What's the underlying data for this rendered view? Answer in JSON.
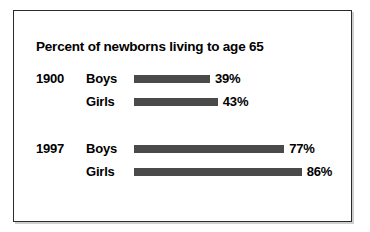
{
  "frame": {
    "border_color": "#2b2b2b",
    "background": "#ffffff"
  },
  "chart_data": {
    "type": "bar",
    "orientation": "horizontal",
    "title": "Percent of newborns living to age 65",
    "xlabel": "",
    "ylabel": "",
    "xlim": [
      0,
      100
    ],
    "grid": false,
    "legend": "none",
    "bar_color": "#4a4a4a",
    "groups": [
      {
        "label": "1900",
        "rows": [
          {
            "category": "Boys",
            "value": 39,
            "value_label": "39%"
          },
          {
            "category": "Girls",
            "value": 43,
            "value_label": "43%"
          }
        ]
      },
      {
        "label": "1997",
        "rows": [
          {
            "category": "Boys",
            "value": 77,
            "value_label": "77%"
          },
          {
            "category": "Girls",
            "value": 86,
            "value_label": "86%"
          }
        ]
      }
    ],
    "categories": [
      "1900 Boys",
      "1900 Girls",
      "1997 Boys",
      "1997 Girls"
    ],
    "values": [
      39,
      43,
      77,
      86
    ]
  }
}
